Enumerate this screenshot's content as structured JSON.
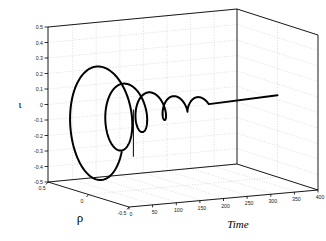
{
  "figure": {
    "background_color": "#ffffff",
    "curve_color": "#000000",
    "axis_color": "#000000",
    "grid_color": "#b9b9b9",
    "grid_style": "dotted"
  },
  "axes": {
    "y": {
      "label": "ι",
      "ticks": [
        "0.5",
        "0.4",
        "0.3",
        "0.2",
        "0.1",
        "0",
        "-0.1",
        "-0.2",
        "-0.3",
        "-0.4",
        "-0.5"
      ],
      "values": [
        0.5,
        0.4,
        0.3,
        0.2,
        0.1,
        0,
        -0.1,
        -0.2,
        -0.3,
        -0.4,
        -0.5
      ],
      "lim": [
        -0.5,
        0.5
      ]
    },
    "depth": {
      "label": "ρ",
      "ticks": [
        "0.5",
        "0",
        "-0.5"
      ],
      "values": [
        0.5,
        0,
        -0.5
      ],
      "lim": [
        -0.5,
        0.5
      ]
    },
    "x": {
      "label": "Time",
      "ticks": [
        "0",
        "50",
        "100",
        "150",
        "200",
        "250",
        "300",
        "350",
        "400"
      ],
      "values": [
        0,
        50,
        100,
        150,
        200,
        250,
        300,
        350,
        400
      ],
      "lim": [
        0,
        400
      ]
    }
  },
  "chart_data": {
    "type": "line",
    "title": "",
    "xlabel": "Time",
    "ylabel": "ι",
    "zlabel": "ρ",
    "xlim": [
      0,
      400
    ],
    "ylim": [
      -0.5,
      0.5
    ],
    "zlim": [
      -0.5,
      0.5
    ],
    "grid": true,
    "legend": null,
    "projection": "3d",
    "series": [
      {
        "name": "trajectory",
        "color": "#000000",
        "line_width": 2,
        "points_note": "parametric damped spiral: iota = A(t)*cos(w t + p), rho = A(t)*sin(w t + p), A decays from ~0.44 to ~0.03 over t = 0..250",
        "amplitude_start": 0.44,
        "amplitude_end": 0.03,
        "cycles": 5,
        "settle_time": 250,
        "final_value": 0.03
      }
    ]
  }
}
